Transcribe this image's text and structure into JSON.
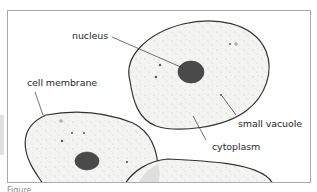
{
  "diagram": {
    "labels": {
      "nucleus": "nucleus",
      "cell_membrane": "cell membrane",
      "small_vacuole": "small vacuole",
      "cytoplasm": "cytoplasm"
    },
    "caption": "Figure . . . . .  .  .  .  . . . .  .  .  .  . . . ."
  },
  "colors": {
    "outline": "#333333",
    "cell_fill": "#f3f3f1",
    "nucleus": "#4a4a4a",
    "frame": "#aaaaaa"
  }
}
